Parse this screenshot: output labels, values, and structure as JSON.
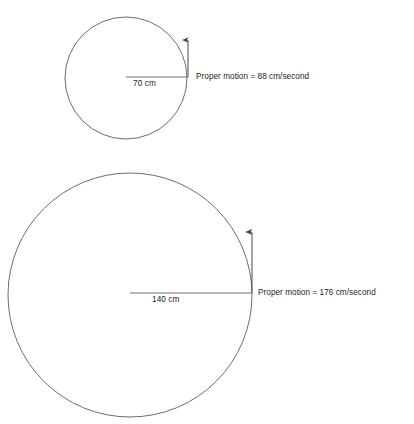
{
  "canvas": {
    "width": 414,
    "height": 424,
    "background_color": "#ffffff",
    "stroke_color": "#6e6e6e",
    "arrow_color": "#4a4a4a",
    "text_color": "#1c1c1c"
  },
  "figures": [
    {
      "id": "top",
      "name": "small-circle-figure",
      "circle": {
        "center_x": 126,
        "center_y": 78,
        "radius_px": 61
      },
      "radius_line": {
        "from_x": 126,
        "from_y": 77,
        "to_x": 188,
        "to_y": 77
      },
      "radius_label": "70 cm",
      "arrow": {
        "x": 188,
        "from_y": 77,
        "to_y": 40
      },
      "motion_label": "Proper motion = 88 cm/second"
    },
    {
      "id": "bottom",
      "name": "large-circle-figure",
      "circle": {
        "center_x": 130,
        "center_y": 295,
        "radius_px": 122
      },
      "radius_line": {
        "from_x": 130,
        "from_y": 293,
        "to_x": 252,
        "to_y": 293
      },
      "radius_label": "140 cm",
      "arrow": {
        "x": 252,
        "from_y": 293,
        "to_y": 232
      },
      "motion_label": "Proper motion = 176 cm/second"
    }
  ],
  "chart_data": {
    "type": "diagram",
    "title": "",
    "categories": [
      "70 cm",
      "140 cm"
    ],
    "series": [
      {
        "name": "Radius (cm)",
        "values": [
          70,
          140
        ]
      },
      {
        "name": "Proper motion (cm/second)",
        "values": [
          88,
          176
        ]
      }
    ],
    "annotations": [
      "70 cm",
      "Proper motion = 88 cm/second",
      "140 cm",
      "Proper motion = 176 cm/second"
    ],
    "units": {
      "radius": "cm",
      "proper_motion": "cm/second"
    },
    "grid": false,
    "legend": "none"
  }
}
